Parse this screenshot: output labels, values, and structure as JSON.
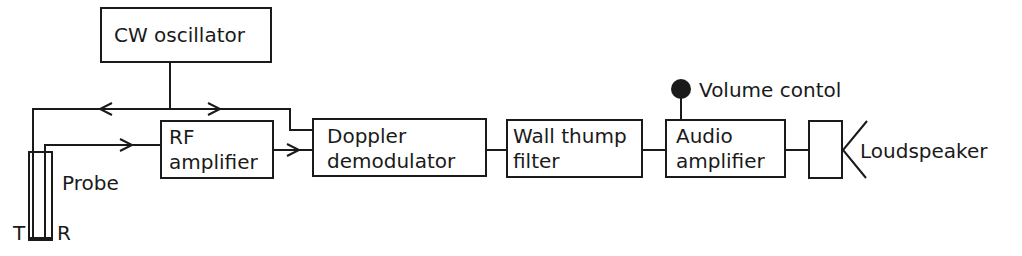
{
  "diagram": {
    "type": "block-diagram",
    "blocks": {
      "cw_oscillator": {
        "label": "CW oscillator"
      },
      "rf_amplifier": {
        "line1": "RF",
        "line2": "amplifier"
      },
      "doppler_demodulator": {
        "line1": "Doppler",
        "line2": "demodulator"
      },
      "wall_thump_filter": {
        "line1": "Wall thump",
        "line2": "filter"
      },
      "audio_amplifier": {
        "line1": "Audio",
        "line2": "amplifier"
      },
      "loudspeaker": {
        "label": "Loudspeaker"
      }
    },
    "labels": {
      "probe": "Probe",
      "transmit": "T",
      "receive": "R",
      "volume_control": "Volume contol"
    },
    "colors": {
      "stroke": "#1a1a1a",
      "background": "#ffffff"
    }
  }
}
